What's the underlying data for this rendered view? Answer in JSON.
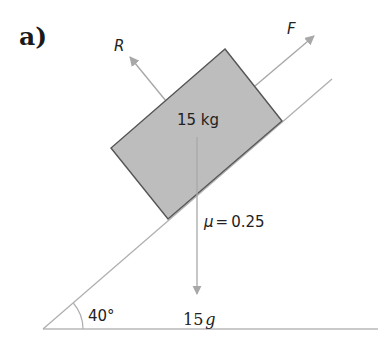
{
  "part_label": "a)",
  "block": {
    "mass_label": "15 kg",
    "fill_color": "#bdbdbd",
    "edge_color": "#555555"
  },
  "forces": {
    "reaction": {
      "label": "R"
    },
    "applied": {
      "label": "F"
    },
    "weight": {
      "label_value": "15",
      "label_unit": "g"
    }
  },
  "friction": {
    "symbol": "μ",
    "equals": "=",
    "value": "0.25"
  },
  "incline": {
    "angle_label": "40°",
    "line_color": "#b0b0b0"
  },
  "arrow_color": "#a8a8a8"
}
